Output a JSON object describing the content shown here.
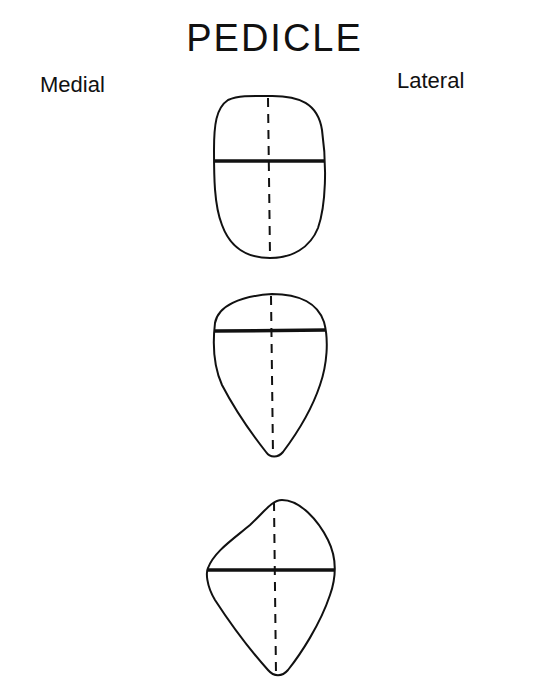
{
  "title": "PEDICLE",
  "labels": {
    "left": "Medial",
    "right": "Lateral"
  },
  "colors": {
    "ink": "#111111",
    "background": "#ffffff"
  },
  "shapes": [
    {
      "name": "oval",
      "description": "Rounded oval cross-section with horizontal width line near middle",
      "bounds": {
        "left": 214,
        "top": 96,
        "right": 325,
        "bottom": 258
      },
      "horizontal_axis_y": 161,
      "vertical_axis_x": 268
    },
    {
      "name": "teardrop",
      "description": "Teardrop cross-section tapering inferiorly with horizontal width line in upper third",
      "bounds": {
        "left": 214,
        "top": 294,
        "right": 327,
        "bottom": 457
      },
      "horizontal_axis_y": 331,
      "vertical_axis_x": 273
    },
    {
      "name": "kidney-teardrop",
      "description": "Irregular kite-shaped cross-section with widest horizontal line at mid height",
      "bounds": {
        "left": 207,
        "top": 500,
        "right": 335,
        "bottom": 676
      },
      "horizontal_axis_y": 570,
      "vertical_axis_x": 275
    }
  ]
}
